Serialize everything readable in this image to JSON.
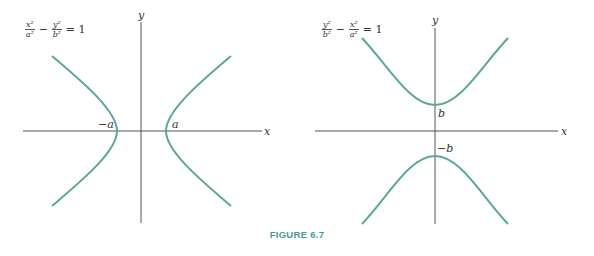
{
  "colors": {
    "curve": "#5aa89a",
    "axis": "#555555",
    "caption": "#4a9a9a"
  },
  "left_panel": {
    "formula": {
      "term1_num": "x²",
      "term1_den": "a²",
      "minus": "−",
      "term2_num": "y²",
      "term2_den": "b²",
      "equals": "= 1"
    },
    "axis_labels": {
      "x": "x",
      "y": "y"
    },
    "vertex_labels": {
      "neg": "−a",
      "pos": "a"
    }
  },
  "right_panel": {
    "formula": {
      "term1_num": "y²",
      "term1_den": "b²",
      "minus": "−",
      "term2_num": "x²",
      "term2_den": "a²",
      "equals": "= 1"
    },
    "axis_labels": {
      "x": "x",
      "y": "y"
    },
    "vertex_labels": {
      "pos": "b",
      "neg": "−b"
    }
  },
  "caption": "FIGURE 6.7"
}
